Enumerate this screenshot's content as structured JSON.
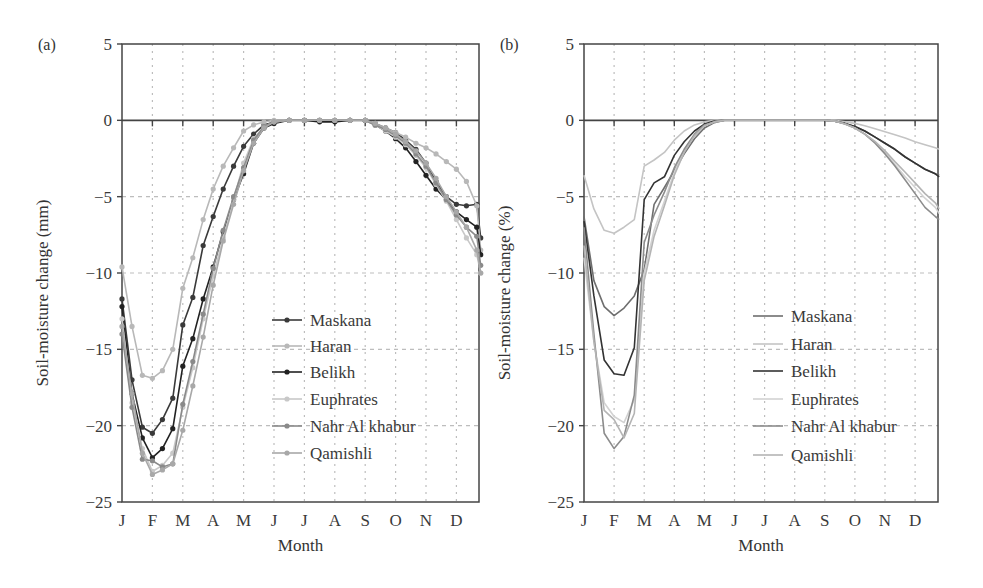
{
  "figure": {
    "panels": [
      "(a)",
      "(b)"
    ]
  },
  "chart_data": [
    {
      "type": "line",
      "panel_label": "(a)",
      "title": "",
      "xlabel": "Month",
      "ylabel": "Soil-moisture change (mm)",
      "ylim": [
        -25,
        5
      ],
      "yticks": [
        5,
        0,
        -5,
        -10,
        -15,
        -20,
        -25
      ],
      "ytick_labels": [
        "5",
        "0",
        "−5",
        "−10",
        "−15",
        "−20",
        "−25"
      ],
      "categories": [
        "J",
        "F",
        "M",
        "A",
        "M",
        "J",
        "J",
        "A",
        "S",
        "O",
        "N",
        "D"
      ],
      "grid": true,
      "legend_position": "center-left inside",
      "markers": true,
      "x": [
        0,
        0.33,
        0.67,
        1,
        1.33,
        1.67,
        2,
        2.33,
        2.67,
        3,
        3.33,
        3.67,
        4,
        4.33,
        4.67,
        5,
        5.5,
        6,
        6.5,
        7,
        7.5,
        8,
        8.33,
        8.67,
        9,
        9.33,
        9.67,
        10,
        10.33,
        10.67,
        11,
        11.33,
        11.67,
        11.8
      ],
      "series": [
        {
          "name": "Maskana",
          "color": "#3a3a3a",
          "values": [
            -11.7,
            -17,
            -20.1,
            -20.5,
            -19.6,
            -18.2,
            -13.4,
            -11.6,
            -8.2,
            -6.3,
            -4.5,
            -3.0,
            -1.7,
            -0.9,
            -0.3,
            -0.1,
            0,
            0,
            0,
            0,
            0,
            0,
            -0.2,
            -0.5,
            -0.8,
            -1.3,
            -1.9,
            -2.8,
            -4.0,
            -5.0,
            -5.5,
            -5.6,
            -5.5,
            -7.7
          ]
        },
        {
          "name": "Haran",
          "color": "#b8b8b8",
          "values": [
            -9.6,
            -13.5,
            -16.7,
            -16.9,
            -16.4,
            -15.0,
            -11.0,
            -9.0,
            -6.5,
            -4.5,
            -3.0,
            -1.8,
            -0.7,
            -0.3,
            -0.1,
            0,
            0,
            0,
            0,
            0,
            0,
            0,
            -0.2,
            -0.5,
            -0.8,
            -1.1,
            -1.5,
            -1.8,
            -2.2,
            -2.7,
            -3.2,
            -4.0,
            -5.6,
            -8.5
          ]
        },
        {
          "name": "Belikh",
          "color": "#222222",
          "values": [
            -12.2,
            -17.9,
            -20.8,
            -22.1,
            -21.5,
            -20.2,
            -16.1,
            -14.3,
            -11.7,
            -9.6,
            -7.3,
            -5.2,
            -3.5,
            -1.5,
            -0.5,
            -0.2,
            0,
            0,
            -0.1,
            -0.1,
            0,
            0,
            -0.3,
            -0.7,
            -1.2,
            -1.8,
            -2.7,
            -3.6,
            -4.5,
            -5.2,
            -6.0,
            -6.5,
            -7.0,
            -8.8
          ]
        },
        {
          "name": "Euphrates",
          "color": "#c8c8c8",
          "values": [
            -13.0,
            -18.5,
            -21.5,
            -23.0,
            -22.6,
            -21.8,
            -18.8,
            -16.2,
            -13.0,
            -10.2,
            -7.7,
            -5.2,
            -2.8,
            -1.2,
            -0.4,
            -0.1,
            0,
            0,
            0,
            0,
            0,
            0,
            -0.3,
            -0.7,
            -1.1,
            -1.6,
            -2.3,
            -3.1,
            -4.2,
            -5.3,
            -6.5,
            -7.7,
            -8.8,
            -10.0
          ]
        },
        {
          "name": "Nahr Al khabur",
          "color": "#8a8a8a",
          "values": [
            -14.0,
            -18.8,
            -22.2,
            -22.3,
            -22.7,
            -22.5,
            -18.6,
            -15.8,
            -12.7,
            -9.7,
            -7.2,
            -5.0,
            -3.1,
            -1.3,
            -0.4,
            -0.1,
            0,
            0,
            0,
            0,
            0,
            0,
            -0.3,
            -0.6,
            -1.0,
            -1.5,
            -2.2,
            -3.0,
            -4.1,
            -5.2,
            -6.2,
            -7.0,
            -7.6,
            -9.5
          ]
        },
        {
          "name": "Qamishli",
          "color": "#a8a8a8",
          "values": [
            -13.5,
            -17.9,
            -21.8,
            -23.2,
            -22.9,
            -22.5,
            -20.3,
            -17.4,
            -14.2,
            -10.8,
            -7.9,
            -5.5,
            -3.3,
            -1.5,
            -0.5,
            -0.1,
            0,
            0,
            0,
            0,
            0,
            0,
            -0.2,
            -0.5,
            -0.9,
            -1.4,
            -2.0,
            -2.8,
            -3.8,
            -5.0,
            -6.0,
            -7.0,
            -8.5,
            -10.0
          ]
        }
      ]
    },
    {
      "type": "line",
      "panel_label": "(b)",
      "title": "",
      "xlabel": "Month",
      "ylabel": "Soil-moisture change (%)",
      "ylim": [
        -25,
        5
      ],
      "yticks": [
        5,
        0,
        -5,
        -10,
        -15,
        -20,
        -25
      ],
      "ytick_labels": [
        "5",
        "0",
        "−5",
        "−10",
        "−15",
        "−20",
        "−25"
      ],
      "categories": [
        "J",
        "F",
        "M",
        "A",
        "M",
        "J",
        "J",
        "A",
        "S",
        "O",
        "N",
        "D"
      ],
      "grid": true,
      "legend_position": "center-right inside",
      "markers": false,
      "x": [
        0,
        0.33,
        0.67,
        1,
        1.33,
        1.67,
        2,
        2.33,
        2.67,
        3,
        3.33,
        3.67,
        4,
        4.33,
        4.67,
        5,
        5.5,
        6,
        6.5,
        7,
        7.5,
        8,
        8.33,
        8.67,
        9,
        9.33,
        9.67,
        10,
        10.33,
        10.67,
        11,
        11.33,
        11.67,
        11.8
      ],
      "series": [
        {
          "name": "Maskana",
          "color": "#6e6e6e",
          "values": [
            -6.3,
            -10.5,
            -12.2,
            -12.8,
            -12.3,
            -11.5,
            -9.8,
            -5.5,
            -4.4,
            -3.3,
            -2.2,
            -1.2,
            -0.5,
            -0.15,
            0,
            0,
            0,
            0,
            0,
            0,
            0,
            0,
            -0.05,
            -0.2,
            -0.4,
            -0.7,
            -1.1,
            -1.5,
            -1.9,
            -2.4,
            -2.8,
            -3.2,
            -3.5,
            -3.6
          ]
        },
        {
          "name": "Haran",
          "color": "#c4c4c4",
          "values": [
            -3.6,
            -5.8,
            -7.2,
            -7.4,
            -7.0,
            -6.5,
            -3.0,
            -2.6,
            -2.1,
            -1.3,
            -0.7,
            -0.3,
            -0.1,
            0,
            0,
            0,
            0,
            0,
            0,
            0,
            0,
            0,
            0,
            -0.1,
            -0.2,
            -0.35,
            -0.55,
            -0.75,
            -0.95,
            -1.15,
            -1.4,
            -1.6,
            -1.8,
            -1.9
          ]
        },
        {
          "name": "Belikh",
          "color": "#333333",
          "values": [
            -6.6,
            -11.5,
            -15.7,
            -16.6,
            -16.7,
            -14.9,
            -5.2,
            -4.1,
            -3.7,
            -2.3,
            -1.4,
            -0.7,
            -0.25,
            -0.05,
            0,
            0,
            0,
            0,
            0,
            0,
            0,
            0,
            -0.05,
            -0.2,
            -0.4,
            -0.7,
            -1.1,
            -1.5,
            -1.9,
            -2.4,
            -2.8,
            -3.2,
            -3.5,
            -3.7
          ]
        },
        {
          "name": "Euphrates",
          "color": "#d2d2d2",
          "values": [
            -9.0,
            -14.5,
            -18.5,
            -19.4,
            -19.8,
            -18.3,
            -10.0,
            -7.2,
            -5.3,
            -3.4,
            -2.0,
            -1.0,
            -0.35,
            -0.1,
            0,
            0,
            0,
            0,
            0,
            0,
            0,
            0,
            -0.05,
            -0.25,
            -0.5,
            -0.9,
            -1.4,
            -2.1,
            -2.9,
            -3.7,
            -4.4,
            -5.1,
            -5.7,
            -6.1
          ]
        },
        {
          "name": "Nahr Al khabur",
          "color": "#8c8c8c",
          "values": [
            -7.0,
            -14.0,
            -20.5,
            -21.5,
            -20.7,
            -18.0,
            -8.0,
            -6.2,
            -4.7,
            -3.1,
            -1.9,
            -0.9,
            -0.3,
            -0.1,
            0,
            0,
            0,
            0,
            0,
            0,
            0,
            0,
            -0.05,
            -0.25,
            -0.5,
            -0.9,
            -1.5,
            -2.2,
            -3.0,
            -3.9,
            -4.8,
            -5.7,
            -6.3,
            -6.5
          ]
        },
        {
          "name": "Qamishli",
          "color": "#b4b4b4",
          "values": [
            -8.2,
            -14.5,
            -19.0,
            -19.6,
            -20.8,
            -19.2,
            -10.5,
            -7.6,
            -5.6,
            -3.6,
            -2.1,
            -1.0,
            -0.35,
            -0.1,
            0,
            0,
            0,
            0,
            0,
            0,
            0,
            0,
            -0.05,
            -0.25,
            -0.5,
            -0.9,
            -1.4,
            -2.0,
            -2.7,
            -3.4,
            -4.1,
            -4.8,
            -5.4,
            -5.8
          ]
        }
      ]
    }
  ]
}
